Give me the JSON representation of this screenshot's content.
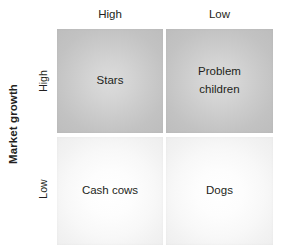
{
  "axes": {
    "y_axis_title": "Market growth",
    "x_ticks": [
      {
        "label": "High"
      },
      {
        "label": "Low"
      }
    ],
    "y_ticks": [
      {
        "label": "High"
      },
      {
        "label": "Low"
      }
    ]
  },
  "quadrants": [
    {
      "name": "stars",
      "label": "Stars",
      "row": "High",
      "column": "High",
      "tone": "dark",
      "fill": "#cacaca"
    },
    {
      "name": "problem-children",
      "label": "Problem children",
      "label_line1": "Problem",
      "label_line2": "children",
      "row": "High",
      "column": "Low",
      "tone": "dark",
      "fill": "#cacaca"
    },
    {
      "name": "cash-cows",
      "label": "Cash cows",
      "row": "Low",
      "column": "High",
      "tone": "light",
      "fill": "#f8f8f8"
    },
    {
      "name": "dogs",
      "label": "Dogs",
      "row": "Low",
      "column": "Low",
      "tone": "light",
      "fill": "#f8f8f8"
    }
  ],
  "colors": {
    "background": "#ffffff",
    "text": "#231f20",
    "quadrant_dark": "#cacaca",
    "quadrant_light": "#f8f8f8"
  }
}
